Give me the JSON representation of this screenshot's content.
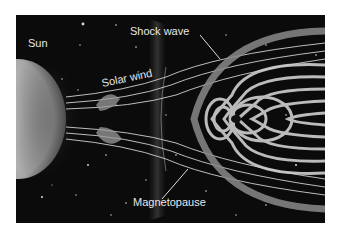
{
  "figure": {
    "labels": {
      "sun": "Sun",
      "solar_wind": "Solar wind",
      "shock_wave": "Shock wave",
      "magnetopause": "Magnetopause"
    },
    "colors": {
      "background": "#0b0b0b",
      "field_lines": "#d9d9d9",
      "sun": "#bdbdbd",
      "page": "#ffffff"
    }
  }
}
